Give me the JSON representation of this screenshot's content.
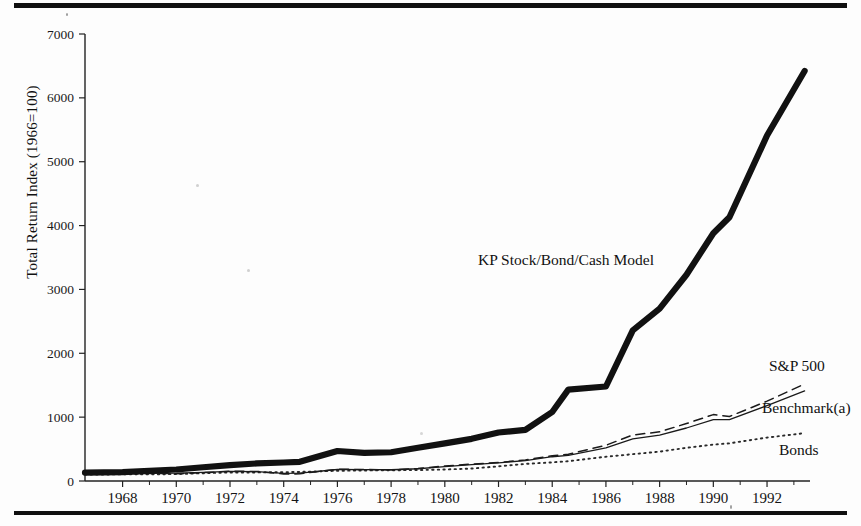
{
  "figure": {
    "ylabel": "Total Return Index (1966=100)",
    "top_rule": true,
    "bottom_rule": true
  },
  "axis": {
    "y_ticks": [
      "0",
      "1000",
      "2000",
      "3000",
      "4000",
      "5000",
      "6000",
      "7000"
    ],
    "x_ticks": [
      "1968",
      "1970",
      "1972",
      "1974",
      "1976",
      "1978",
      "1980",
      "1982",
      "1984",
      "1986",
      "1988",
      "1990",
      "1992"
    ]
  },
  "labels": {
    "kp_model": "KP Stock/Bond/Cash Model",
    "sp500": "S&P 500",
    "benchmark": "Benchmark(a)",
    "bonds": "Bonds"
  },
  "chart_data": {
    "type": "line",
    "title": "",
    "xlabel": "",
    "ylabel": "Total Return Index (1966=100)",
    "xlim": [
      1966.6,
      1993.6
    ],
    "ylim": [
      0,
      7000
    ],
    "grid": false,
    "legend": "inline-annotations",
    "x": [
      1966.6,
      1968,
      1969,
      1970,
      1971,
      1972,
      1973,
      1974,
      1974.6,
      1976,
      1977,
      1978,
      1979,
      1980,
      1981,
      1982,
      1983,
      1984,
      1984.6,
      1986,
      1987,
      1988,
      1989,
      1990,
      1990.6,
      1992,
      1993.4
    ],
    "series": [
      {
        "name": "KP Stock/Bond/Cash Model",
        "style": "thick-solid",
        "color": "#111111",
        "values": [
          130,
          140,
          160,
          180,
          215,
          250,
          275,
          290,
          300,
          470,
          440,
          450,
          520,
          590,
          660,
          760,
          800,
          1080,
          1430,
          1480,
          2360,
          2700,
          3230,
          3880,
          4130,
          5410,
          6420
        ]
      },
      {
        "name": "S&P 500",
        "style": "dashed",
        "color": "#1a1a1a",
        "values": [
          110,
          120,
          118,
          115,
          130,
          152,
          150,
          110,
          112,
          185,
          180,
          175,
          195,
          235,
          265,
          290,
          330,
          395,
          420,
          560,
          720,
          770,
          900,
          1040,
          1010,
          1250,
          1520
        ]
      },
      {
        "name": "Benchmark(a)",
        "style": "thin-solid",
        "color": "#1a1a1a",
        "values": [
          110,
          118,
          120,
          122,
          136,
          150,
          148,
          120,
          122,
          180,
          178,
          176,
          192,
          225,
          255,
          285,
          320,
          380,
          400,
          520,
          660,
          720,
          830,
          960,
          960,
          1180,
          1410
        ]
      },
      {
        "name": "Bonds",
        "style": "dotted",
        "color": "#2a2a2a",
        "values": [
          100,
          104,
          104,
          108,
          122,
          134,
          134,
          138,
          142,
          160,
          165,
          168,
          172,
          180,
          195,
          230,
          268,
          292,
          310,
          380,
          420,
          460,
          520,
          570,
          590,
          680,
          750
        ]
      }
    ]
  }
}
